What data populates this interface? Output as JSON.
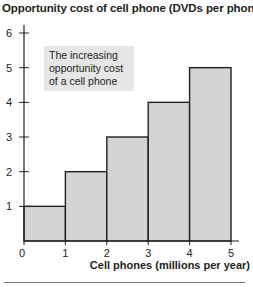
{
  "chart_data": {
    "type": "bar",
    "title": "Opportunity cost of cell phone (DVDs per phone)",
    "xlabel": "Cell phones (millions per year)",
    "ylabel": "Opportunity cost of cell phone (DVDs per phone)",
    "categories": [
      "0-1",
      "1-2",
      "2-3",
      "3-4",
      "4-5"
    ],
    "bins": [
      [
        0,
        1
      ],
      [
        1,
        2
      ],
      [
        2,
        3
      ],
      [
        3,
        4
      ],
      [
        4,
        5
      ]
    ],
    "values": [
      1,
      2,
      3,
      4,
      5
    ],
    "xlim": [
      0,
      5
    ],
    "ylim": [
      0,
      6
    ],
    "x_ticks": [
      "0",
      "1",
      "2",
      "3",
      "4",
      "5"
    ],
    "y_ticks": [
      "1",
      "2",
      "3",
      "4",
      "5",
      "6"
    ],
    "grid": false,
    "annotation": "The increasing opportunity cost of a cell phone",
    "bar_color": "#d4d4d4",
    "bar_edge_color": "#231f20"
  },
  "annotation_text": "The increasing opportunity cost of a cell phone"
}
